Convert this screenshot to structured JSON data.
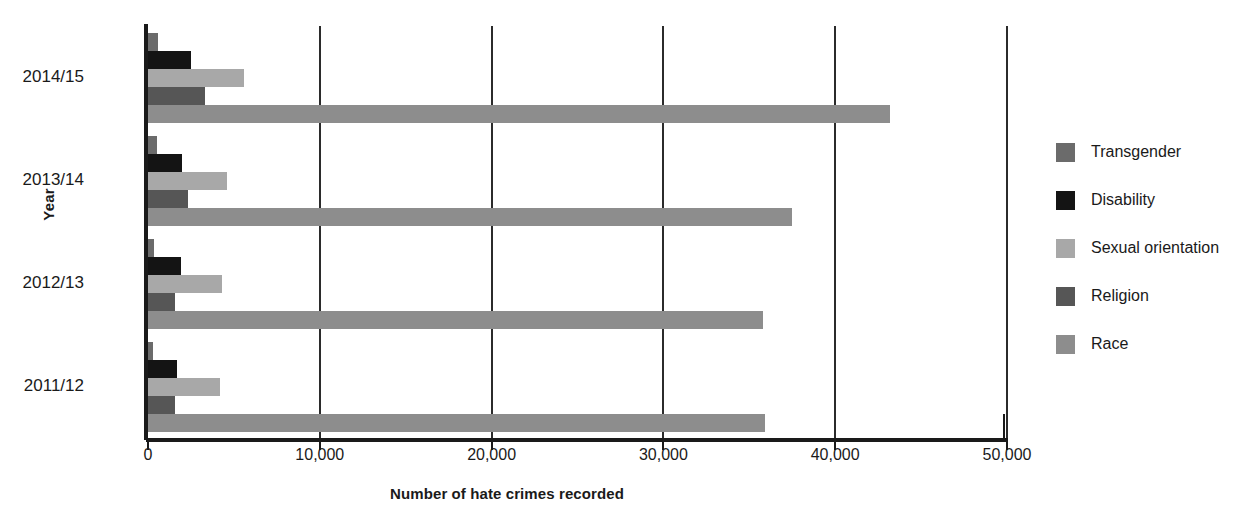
{
  "chart_data": {
    "type": "bar",
    "orientation": "horizontal",
    "title": "",
    "xlabel": "Number of hate crimes recorded",
    "ylabel": "Year",
    "categories": [
      "2014/15",
      "2013/14",
      "2012/13",
      "2011/12"
    ],
    "xlim": [
      0,
      50000
    ],
    "xticks": [
      0,
      10000,
      20000,
      30000,
      40000,
      50000
    ],
    "xtick_labels": [
      "0",
      "10,000",
      "20,000",
      "30,000",
      "40,000",
      "50,000"
    ],
    "grid": "vertical gridlines at each 10,000 tick",
    "legend_position": "right",
    "series": [
      {
        "name": "Transgender",
        "color": "#6b6b6b",
        "values": [
          600,
          550,
          350,
          300
        ]
      },
      {
        "name": "Disability",
        "color": "#141414",
        "values": [
          2500,
          2000,
          1900,
          1700
        ]
      },
      {
        "name": "Sexual orientation",
        "color": "#a8a8a8",
        "values": [
          5600,
          4600,
          4300,
          4200
        ]
      },
      {
        "name": "Religion",
        "color": "#565656",
        "values": [
          3300,
          2300,
          1600,
          1600
        ]
      },
      {
        "name": "Race",
        "color": "#8d8d8d",
        "values": [
          43200,
          37500,
          35800,
          35900
        ]
      }
    ]
  },
  "axis": {
    "y_title": "Year",
    "x_title": "Number of hate crimes recorded"
  },
  "legend": {
    "items": [
      {
        "label": "Transgender",
        "color": "#6b6b6b"
      },
      {
        "label": "Disability",
        "color": "#141414"
      },
      {
        "label": "Sexual orientation",
        "color": "#a8a8a8"
      },
      {
        "label": "Religion",
        "color": "#565656"
      },
      {
        "label": "Race",
        "color": "#8d8d8d"
      }
    ]
  },
  "colors": {
    "axis": "#1a1a1a",
    "gridline": "#2b2b2b",
    "background": "#ffffff",
    "text": "#1a1a1a"
  }
}
